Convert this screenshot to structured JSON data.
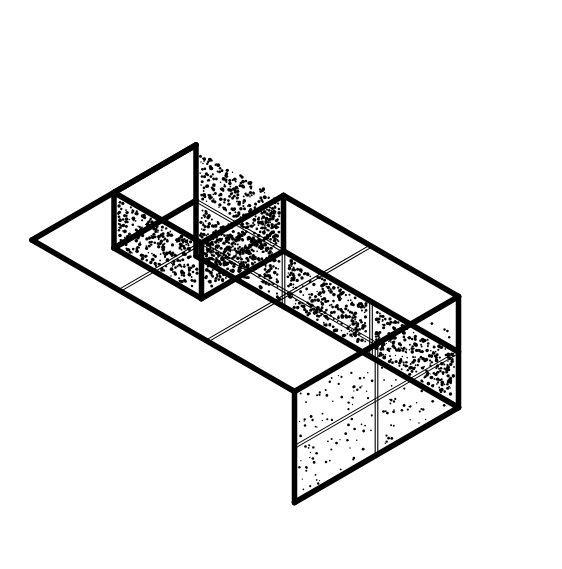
{
  "canvas": {
    "width": 562,
    "height": 569,
    "background_color": "#ffffff",
    "ink_color": "#000000",
    "title": "Isometric stepped block assembly"
  },
  "figure": {
    "name": "isometric-stepped-block",
    "projection": "isometric",
    "line_color": "#000000",
    "outline_width": 5.5,
    "seam_width": 1.1,
    "seam_gap": 2.6,
    "fill_color": "#ffffff"
  },
  "geometry": {
    "origin": {
      "x": 196,
      "y": 145
    },
    "axis_u": {
      "dx": 87.5,
      "dy": 50.5,
      "label": "right-depth axis"
    },
    "axis_v": {
      "dx": -82.0,
      "dy": 47.5,
      "label": "left-width axis"
    },
    "axis_w": {
      "dx": 0,
      "dy": 55.5,
      "label": "vertical down axis"
    },
    "grid_counts": {
      "u": 3,
      "v": 2,
      "w": 2
    },
    "notch": {
      "u_cells": 1,
      "v_cells": 1,
      "w_cells": 1,
      "corner": "top-near-left"
    }
  },
  "vertices": {
    "top_apex": {
      "x": 196,
      "y": 34
    },
    "top_left": {
      "x": 32,
      "y": 145
    },
    "top_right": {
      "x": 527,
      "y": 258
    },
    "top_far_junction": {
      "x": 196,
      "y": 145
    },
    "notch_floor_left": {
      "x": 118,
      "y": 303
    },
    "notch_floor_center": {
      "x": 283,
      "y": 312
    },
    "front_mid": {
      "x": 283,
      "y": 412
    },
    "bottom_front": {
      "x": 282,
      "y": 538
    },
    "bottom_left": {
      "x": 32,
      "y": 368
    },
    "bottom_right": {
      "x": 527,
      "y": 480
    }
  },
  "faces": [
    {
      "id": "top-far-left",
      "name": "top-face-cell-far-left",
      "plane": "top",
      "texture": "blank"
    },
    {
      "id": "top-far-mid",
      "name": "top-face-cell-far-mid",
      "plane": "top",
      "texture": "blank"
    },
    {
      "id": "top-far-right",
      "name": "top-face-cell-far-right",
      "plane": "top",
      "texture": "blank"
    },
    {
      "id": "top-near-right",
      "name": "top-face-cell-near-right",
      "plane": "top",
      "texture": "blank"
    },
    {
      "id": "top-near-mid",
      "name": "top-face-cell-near-mid",
      "plane": "top",
      "texture": "blank"
    },
    {
      "id": "notch-floor",
      "name": "notch-floor-face",
      "plane": "top",
      "texture": "blank"
    },
    {
      "id": "notch-wall-left",
      "name": "notch-wall-left-face",
      "plane": "left",
      "texture": "blank"
    },
    {
      "id": "notch-wall-right-a",
      "name": "notch-wall-right-face-a",
      "plane": "right",
      "texture": "stipple-heavy"
    },
    {
      "id": "notch-wall-right-b",
      "name": "notch-wall-right-face-b",
      "plane": "right",
      "texture": "stipple-heavy"
    },
    {
      "id": "left-upper-back",
      "name": "left-face-cell-upper-back",
      "plane": "left",
      "texture": "stipple-heavy"
    },
    {
      "id": "left-lower-back",
      "name": "left-face-cell-lower-back",
      "plane": "left",
      "texture": "stipple-heavy"
    },
    {
      "id": "left-lower-front",
      "name": "left-face-cell-lower-front",
      "plane": "left",
      "texture": "stipple-heavy"
    },
    {
      "id": "front-lower-left",
      "name": "front-face-cell-lower-left",
      "plane": "left",
      "texture": "stipple-heavy"
    },
    {
      "id": "front-lower-a",
      "name": "front-face-cell-lower-a",
      "plane": "right",
      "texture": "stipple-light"
    },
    {
      "id": "front-lower-b",
      "name": "front-face-cell-lower-b",
      "plane": "right",
      "texture": "stipple-light"
    },
    {
      "id": "front-lower-c",
      "name": "front-face-cell-lower-c",
      "plane": "right",
      "texture": "stipple-light"
    },
    {
      "id": "right-upper",
      "name": "right-face-cell-upper",
      "plane": "right",
      "texture": "stipple-light"
    }
  ],
  "textures": {
    "stipple-heavy": {
      "label": "dense stipple",
      "density": 0.055,
      "dot_radius": 1.35
    },
    "stipple-light": {
      "label": "sparse stipple",
      "density": 0.01,
      "dot_radius": 1.05
    },
    "blank": {
      "label": "no texture",
      "density": 0,
      "dot_radius": 0
    }
  }
}
